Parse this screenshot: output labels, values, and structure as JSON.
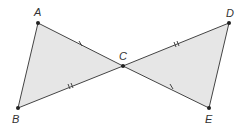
{
  "diagram": {
    "points": {
      "A": {
        "label": "A",
        "x": 38,
        "y": 23
      },
      "B": {
        "label": "B",
        "x": 18,
        "y": 108
      },
      "C": {
        "label": "C",
        "x": 123,
        "y": 66
      },
      "D": {
        "label": "D",
        "x": 229,
        "y": 23
      },
      "E": {
        "label": "E",
        "x": 209,
        "y": 108
      }
    },
    "triangles": [
      "ABC",
      "CDE"
    ],
    "congruence_marks": {
      "AC": 1,
      "CE": 1,
      "BC": 2,
      "CD": 2
    },
    "colors": {
      "fill": "#e6e6e6",
      "stroke": "#444444",
      "point": "#222222"
    }
  }
}
